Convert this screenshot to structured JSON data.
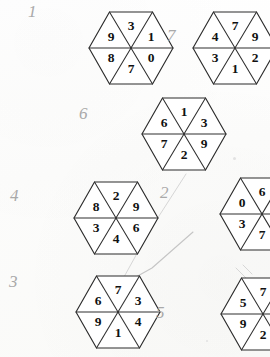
{
  "page": {
    "background_color": "#fdfdfc",
    "ink_color": "#2b2b2b",
    "pencil_color": "#b9b9b9"
  },
  "hexagons": [
    {
      "id": "hex-top-left",
      "pencil_label": "1",
      "label_x": 28,
      "label_y": 2,
      "x": 88,
      "y": 10,
      "digits": {
        "top": "3",
        "upper_right": "1",
        "lower_right": "0",
        "bottom": "7",
        "lower_left": "8",
        "upper_left": "9"
      }
    },
    {
      "id": "hex-top-right",
      "pencil_label": "7",
      "label_x": 167,
      "label_y": 26,
      "x": 192,
      "y": 10,
      "digits": {
        "top": "7",
        "upper_right": "9",
        "lower_right": "2",
        "bottom": "1",
        "lower_left": "3",
        "upper_left": "4"
      }
    },
    {
      "id": "hex-middle",
      "pencil_label": "6",
      "label_x": 79,
      "label_y": 104,
      "x": 141,
      "y": 96,
      "digits": {
        "top": "1",
        "upper_right": "3",
        "lower_right": "9",
        "bottom": "2",
        "lower_left": "7",
        "upper_left": "6"
      }
    },
    {
      "id": "hex-mid-left",
      "pencil_label": "4",
      "label_x": 10,
      "label_y": 186,
      "x": 73,
      "y": 180,
      "digits": {
        "top": "2",
        "upper_right": "9",
        "lower_right": "6",
        "bottom": "4",
        "lower_left": "3",
        "upper_left": "8"
      }
    },
    {
      "id": "hex-mid-right",
      "pencil_label": "2",
      "label_x": 160,
      "label_y": 183,
      "x": 219,
      "y": 176,
      "digits": {
        "top": "6",
        "upper_right": "5",
        "lower_right": "9",
        "bottom": "7",
        "lower_left": "3",
        "upper_left": "0"
      }
    },
    {
      "id": "hex-bottom-left",
      "pencil_label": "3",
      "label_x": 9,
      "label_y": 272,
      "x": 75,
      "y": 274,
      "digits": {
        "top": "7",
        "upper_right": "3",
        "lower_right": "4",
        "bottom": "1",
        "lower_left": "9",
        "upper_left": "6"
      }
    },
    {
      "id": "hex-bottom-right",
      "pencil_label": "5",
      "label_x": 156,
      "label_y": 303,
      "x": 220,
      "y": 276,
      "digits": {
        "top": "7",
        "upper_right": "8",
        "lower_right": "6",
        "bottom": "2",
        "lower_left": "9",
        "upper_left": "5"
      }
    }
  ],
  "annotations": {
    "arrow_description": "faint pencil arrow pointing from upper-right area to the right vertex of hexagon 3",
    "strokes": [
      "M 186,174 L 150,230 L 119,286",
      "M 193,232 L 152,268 L 118,287",
      "M 118,287 L 137,282",
      "M 118,287 L 133,293",
      "M 236,268 L 247,279",
      "M 243,265 L 252,274"
    ]
  }
}
